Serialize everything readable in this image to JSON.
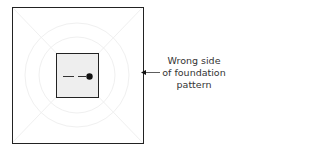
{
  "diagram": {
    "annotation": {
      "lines": [
        "Wrong side",
        "of foundation",
        "pattern"
      ]
    },
    "colors": {
      "outline": "#222222",
      "inner_fill": "#eeeeee",
      "background": "#ffffff",
      "pattern": "#f2f2f2"
    }
  }
}
